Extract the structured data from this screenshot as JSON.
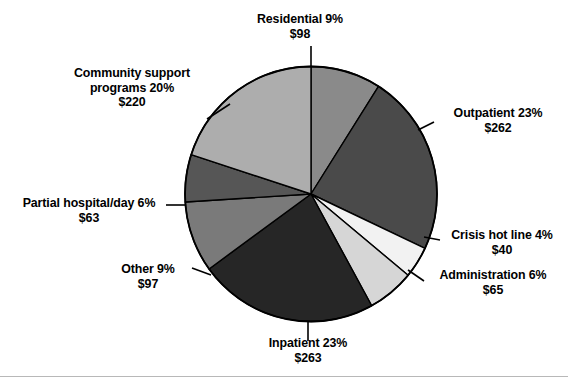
{
  "chart_data": {
    "type": "pie",
    "title": "",
    "subtitle": "",
    "xlabel": "",
    "ylabel": "",
    "legend_position": "none",
    "grid": false,
    "value_prefix": "$",
    "total_value": 1108,
    "start_angle_deg": 0,
    "direction": "clockwise",
    "categories": [
      "Residential",
      "Outpatient",
      "Crisis hot line",
      "Administration",
      "Inpatient",
      "Other",
      "Partial hospital/day",
      "Community support programs"
    ],
    "percents": [
      9,
      23,
      4,
      6,
      23,
      9,
      6,
      20
    ],
    "values": [
      98,
      262,
      40,
      65,
      263,
      97,
      63,
      220
    ],
    "colors": [
      "#8a8a8a",
      "#4a4a4a",
      "#f2f2f2",
      "#d6d6d6",
      "#262626",
      "#7a7a7a",
      "#565656",
      "#adadad"
    ],
    "slices": [
      {
        "name": "Residential",
        "percent": 9,
        "percent_text": "9%",
        "value": 98,
        "value_text": "$98",
        "color": "#8a8a8a",
        "label_text": "Residential 9%"
      },
      {
        "name": "Outpatient",
        "percent": 23,
        "percent_text": "23%",
        "value": 262,
        "value_text": "$262",
        "color": "#4a4a4a",
        "label_text": "Outpatient 23%"
      },
      {
        "name": "Crisis hot line",
        "percent": 4,
        "percent_text": "4%",
        "value": 40,
        "value_text": "$40",
        "color": "#f2f2f2",
        "label_text": "Crisis hot line 4%"
      },
      {
        "name": "Administration",
        "percent": 6,
        "percent_text": "6%",
        "value": 65,
        "value_text": "$65",
        "color": "#d6d6d6",
        "label_text": "Administration 6%"
      },
      {
        "name": "Inpatient",
        "percent": 23,
        "percent_text": "23%",
        "value": 263,
        "value_text": "$263",
        "color": "#262626",
        "label_text": "Inpatient 23%"
      },
      {
        "name": "Other",
        "percent": 9,
        "percent_text": "9%",
        "value": 97,
        "value_text": "$97",
        "color": "#7a7a7a",
        "label_text": "Other 9%"
      },
      {
        "name": "Partial hospital/day",
        "percent": 6,
        "percent_text": "6%",
        "value": 63,
        "value_text": "$63",
        "color": "#565656",
        "label_text": "Partial hospital/day 6%"
      },
      {
        "name": "Community support programs",
        "percent": 20,
        "percent_text": "20%",
        "value": 220,
        "value_text": "$220",
        "color": "#adadad",
        "label_text": "Community support programs 20%"
      }
    ]
  },
  "labels": {
    "residential": {
      "line1": "Residential 9%",
      "line2": "$98"
    },
    "community": {
      "line1": "Community support",
      "line2": "programs 20%",
      "line3": "$220"
    },
    "outpatient": {
      "line1": "Outpatient 23%",
      "line2": "$262"
    },
    "crisis": {
      "line1": "Crisis hot line 4%",
      "line2": "$40"
    },
    "administration": {
      "line1": "Administration 6%",
      "line2": "$65"
    },
    "partial": {
      "line1": "Partial hospital/day 6%",
      "line2": "$63"
    },
    "other": {
      "line1": "Other 9%",
      "line2": "$97"
    },
    "inpatient": {
      "line1": "Inpatient 23%",
      "line2": "$263"
    }
  },
  "style": {
    "background": "#ffffff",
    "text_color": "#000000",
    "slice_stroke": "#000000",
    "rule_color": "#b8b8b8"
  }
}
